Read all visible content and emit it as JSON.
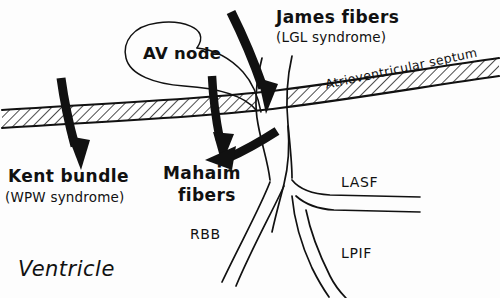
{
  "figure": {
    "width": 500,
    "height": 298,
    "background_color": "#fdfdfd",
    "ink_color": "#111111"
  },
  "labels": {
    "james_fibers": {
      "main": "James fibers",
      "sub": "(LGL syndrome)"
    },
    "kent_bundle": {
      "main": "Kent bundle",
      "sub": "(WPW syndrome)"
    },
    "mahaim_fibers": {
      "line1": "Mahaim",
      "line2": "fibers"
    },
    "av_node": "AV node",
    "septum": "Atrioventricular septum",
    "ventricle": "Ventricle",
    "rbb": "RBB",
    "lasf": "LASF",
    "lpif": "LPIF"
  },
  "structures": {
    "septum_band": {
      "name": "atrioventricular-septum-band",
      "fill": "hatched",
      "outline_color": "#111111"
    },
    "his_bundle": {
      "name": "his-bundle-channel",
      "fill": "#ffffff",
      "outline_color": "#111111"
    },
    "right_bundle_branch": {
      "name": "rbb-channel",
      "label": "RBB"
    },
    "left_anterior_superior_fascicle": {
      "name": "lasf-channel",
      "label": "LASF"
    },
    "left_posterior_inferior_fascicle": {
      "name": "lpif-channel",
      "label": "LPIF"
    },
    "av_node_leader_loop": {
      "name": "av-node-leader-loop"
    }
  },
  "arrows": [
    {
      "name": "james-fibers-arrow",
      "points_to": "AV node / His bundle junction",
      "style": "thick-curved"
    },
    {
      "name": "kent-bundle-arrow",
      "points_to": "across septum to ventricle",
      "style": "thick-straight"
    },
    {
      "name": "mahaim-fibers-arrow-upper",
      "points_to": "Mahaim fibers",
      "style": "thick-curved"
    },
    {
      "name": "mahaim-fibers-arrow-lower",
      "points_to": "Mahaim fibers",
      "style": "thick-straight"
    }
  ]
}
